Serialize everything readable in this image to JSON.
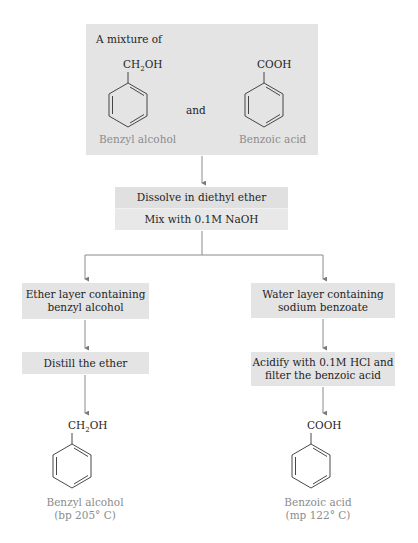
{
  "diagram": {
    "type": "flowchart",
    "start": {
      "heading": "A mixture of",
      "conjunction": "and",
      "compounds": [
        {
          "name": "Benzyl alcohol",
          "substituent_main": "CH",
          "substituent_sub": "2",
          "substituent_tail": "OH"
        },
        {
          "name": "Benzoic acid",
          "substituent_main": "COOH",
          "substituent_sub": "",
          "substituent_tail": ""
        }
      ]
    },
    "step1": {
      "line1": "Dissolve in diethyl ether",
      "line2": "Mix with 0.1M NaOH"
    },
    "left_branch": {
      "layer": [
        "Ether layer containing",
        "benzyl alcohol"
      ],
      "action": "Distill the ether",
      "product": {
        "substituent_main": "CH",
        "substituent_sub": "2",
        "substituent_tail": "OH",
        "name": "Benzyl alcohol",
        "property": "(bp 205° C)"
      }
    },
    "right_branch": {
      "layer": [
        "Water layer containing",
        "sodium benzoate"
      ],
      "action": [
        "Acidify with 0.1M HCl and",
        "filter the benzoic acid"
      ],
      "product": {
        "substituent_main": "COOH",
        "substituent_sub": "",
        "substituent_tail": "",
        "name": "Benzoic acid",
        "property": "(mp 122° C)"
      }
    },
    "colors": {
      "box_fill": "#e4e4e4",
      "line": "#8a8a8a",
      "text": "#1e1e1e",
      "caption_text": "#8c8c8c"
    }
  }
}
